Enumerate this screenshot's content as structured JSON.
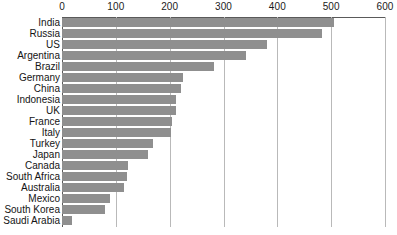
{
  "chart_data": {
    "type": "bar",
    "orientation": "horizontal",
    "title": "",
    "subtitle": "",
    "xlabel": "",
    "ylabel": "",
    "xlim": [
      0,
      600
    ],
    "xticks": [
      0,
      100,
      200,
      300,
      400,
      500,
      600
    ],
    "xtick_labels": [
      "0",
      "100",
      "200",
      "300",
      "400",
      "500",
      "600"
    ],
    "grid": true,
    "grid_axis": "x",
    "legend": false,
    "legend_position": "none",
    "bar_color": "#8f8f8f",
    "grid_color": "#b9b9b9",
    "axis_color": "#5a5a5a",
    "background": "#ffffff",
    "categories": [
      "India",
      "Russia",
      "US",
      "Argentina",
      "Brazil",
      "Germany",
      "China",
      "Indonesia",
      "UK",
      "France",
      "Italy",
      "Turkey",
      "Japan",
      "Canada",
      "South Africa",
      "Australia",
      "Mexico",
      "South Korea",
      "Saudi Arabia"
    ],
    "values": [
      505,
      483,
      381,
      342,
      283,
      225,
      221,
      212,
      212,
      205,
      203,
      169,
      160,
      123,
      121,
      115,
      89,
      80,
      19
    ]
  }
}
